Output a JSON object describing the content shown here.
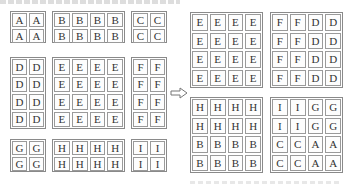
{
  "diagram": {
    "arrow_icon": "hollow-right-arrow",
    "left_groups": [
      {
        "id": "A",
        "rows": [
          [
            "A",
            "A"
          ],
          [
            "A",
            "A"
          ]
        ]
      },
      {
        "id": "B",
        "rows": [
          [
            "B",
            "B",
            "B",
            "B"
          ],
          [
            "B",
            "B",
            "B",
            "B"
          ]
        ]
      },
      {
        "id": "C",
        "rows": [
          [
            "C",
            "C"
          ],
          [
            "C",
            "C"
          ]
        ]
      },
      {
        "id": "D",
        "rows": [
          [
            "D",
            "D"
          ],
          [
            "D",
            "D"
          ],
          [
            "D",
            "D"
          ],
          [
            "D",
            "D"
          ]
        ]
      },
      {
        "id": "E",
        "rows": [
          [
            "E",
            "E",
            "E",
            "E"
          ],
          [
            "E",
            "E",
            "E",
            "E"
          ],
          [
            "E",
            "E",
            "E",
            "E"
          ],
          [
            "E",
            "E",
            "E",
            "E"
          ]
        ]
      },
      {
        "id": "F",
        "rows": [
          [
            "F",
            "F"
          ],
          [
            "F",
            "F"
          ],
          [
            "F",
            "F"
          ],
          [
            "F",
            "F"
          ]
        ]
      },
      {
        "id": "G",
        "rows": [
          [
            "G",
            "G"
          ],
          [
            "G",
            "G"
          ]
        ]
      },
      {
        "id": "H",
        "rows": [
          [
            "H",
            "H",
            "H",
            "H"
          ],
          [
            "H",
            "H",
            "H",
            "H"
          ]
        ]
      },
      {
        "id": "I",
        "rows": [
          [
            "I",
            "I"
          ],
          [
            "I",
            "I"
          ]
        ]
      }
    ],
    "right_blocks": [
      {
        "id": "top-left",
        "rows": [
          [
            "E",
            "E",
            "E",
            "E"
          ],
          [
            "E",
            "E",
            "E",
            "E"
          ],
          [
            "E",
            "E",
            "E",
            "E"
          ],
          [
            "E",
            "E",
            "E",
            "E"
          ]
        ]
      },
      {
        "id": "top-right",
        "rows": [
          [
            "F",
            "F",
            "D",
            "D"
          ],
          [
            "F",
            "F",
            "D",
            "D"
          ],
          [
            "F",
            "F",
            "D",
            "D"
          ],
          [
            "F",
            "F",
            "D",
            "D"
          ]
        ]
      },
      {
        "id": "bottom-left",
        "rows": [
          [
            "H",
            "H",
            "H",
            "H"
          ],
          [
            "H",
            "H",
            "H",
            "H"
          ],
          [
            "B",
            "B",
            "B",
            "B"
          ],
          [
            "B",
            "B",
            "B",
            "B"
          ]
        ]
      },
      {
        "id": "bottom-right",
        "rows": [
          [
            "I",
            "I",
            "G",
            "G"
          ],
          [
            "I",
            "I",
            "G",
            "G"
          ],
          [
            "C",
            "C",
            "A",
            "A"
          ],
          [
            "C",
            "C",
            "A",
            "A"
          ]
        ]
      }
    ]
  }
}
